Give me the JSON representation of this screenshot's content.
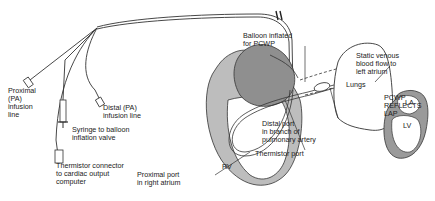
{
  "diagram": {
    "colors": {
      "line": "#333333",
      "myocardium": "#9a9a9a",
      "background": "#ffffff"
    },
    "labels": {
      "proximal_pa_line": "Proximal\n(PA)\ninfusion\nline",
      "distal_pa_line": "Distal (PA)\ninfusion line",
      "syringe": "Syringe to balloon\ninflation valve",
      "thermistor_connector": "Thermistor connector\nto cardiac output\ncomputer",
      "proximal_port": "Proximal port\nin right atrium",
      "rv": "RV",
      "balloon": "Balloon inflated\nfor PCWP",
      "distal_port": "Distal port\nin branch of\npulmonary artery",
      "thermistor_port": "Thermistor port",
      "lungs": "Lungs",
      "static_flow": "Static venous\nblood flow to\nleft atrium",
      "la": "LA",
      "lv": "LV",
      "pcwp_reflects": "PCWP\nREFLECTS\nLAP"
    }
  }
}
